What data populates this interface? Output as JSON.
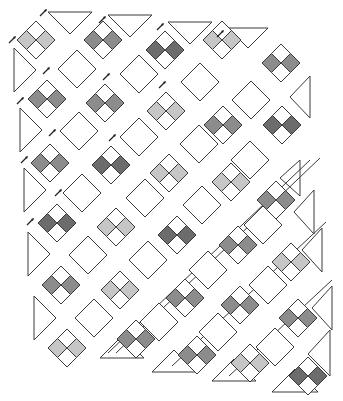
{
  "diagram": {
    "type": "quilt-layout-on-point",
    "colors": {
      "background": "#ffffff",
      "outline": "#3a3a3a",
      "plain": "#ffffff",
      "light": "#c6c6c6",
      "medium": "#8c8c8c",
      "dark": "#6c6c6c"
    },
    "block_half_diagonal": 19,
    "four_patch_blocks": [
      {
        "cx": 36,
        "cy": 40,
        "shade": "light"
      },
      {
        "cx": 103,
        "cy": 40,
        "shade": "medium"
      },
      {
        "cx": 165,
        "cy": 50,
        "shade": "dark"
      },
      {
        "cx": 222,
        "cy": 40,
        "shade": "light"
      },
      {
        "cx": 281,
        "cy": 63,
        "shade": "medium"
      },
      {
        "cx": 47,
        "cy": 99,
        "shade": "medium"
      },
      {
        "cx": 105,
        "cy": 103,
        "shade": "medium"
      },
      {
        "cx": 166,
        "cy": 111,
        "shade": "light"
      },
      {
        "cx": 223,
        "cy": 125,
        "shade": "medium"
      },
      {
        "cx": 282,
        "cy": 125,
        "shade": "dark"
      },
      {
        "cx": 50,
        "cy": 163,
        "shade": "medium"
      },
      {
        "cx": 111,
        "cy": 165,
        "shade": "dark"
      },
      {
        "cx": 169,
        "cy": 173,
        "shade": "light"
      },
      {
        "cx": 231,
        "cy": 182,
        "shade": "light"
      },
      {
        "cx": 276,
        "cy": 200,
        "shade": "medium"
      },
      {
        "cx": 57,
        "cy": 223,
        "shade": "dark"
      },
      {
        "cx": 116,
        "cy": 227,
        "shade": "light"
      },
      {
        "cx": 177,
        "cy": 235,
        "shade": "dark"
      },
      {
        "cx": 238,
        "cy": 245,
        "shade": "medium"
      },
      {
        "cx": 291,
        "cy": 262,
        "shade": "light"
      },
      {
        "cx": 61,
        "cy": 285,
        "shade": "medium"
      },
      {
        "cx": 120,
        "cy": 290,
        "shade": "light"
      },
      {
        "cx": 185,
        "cy": 298,
        "shade": "medium"
      },
      {
        "cx": 240,
        "cy": 305,
        "shade": "medium"
      },
      {
        "cx": 298,
        "cy": 318,
        "shade": "medium"
      },
      {
        "cx": 67,
        "cy": 348,
        "shade": "light"
      },
      {
        "cx": 136,
        "cy": 339,
        "shade": "medium"
      },
      {
        "cx": 197,
        "cy": 355,
        "shade": "medium"
      },
      {
        "cx": 250,
        "cy": 363,
        "shade": "light"
      },
      {
        "cx": 308,
        "cy": 376,
        "shade": "dark"
      }
    ],
    "plain_blocks": [
      {
        "cx": 77,
        "cy": 69
      },
      {
        "cx": 139,
        "cy": 74
      },
      {
        "cx": 200,
        "cy": 82
      },
      {
        "cx": 251,
        "cy": 100
      },
      {
        "cx": 79,
        "cy": 131
      },
      {
        "cx": 139,
        "cy": 137
      },
      {
        "cx": 199,
        "cy": 144
      },
      {
        "cx": 250,
        "cy": 160
      },
      {
        "cx": 82,
        "cy": 193
      },
      {
        "cx": 145,
        "cy": 198
      },
      {
        "cx": 202,
        "cy": 205
      },
      {
        "cx": 263,
        "cy": 225
      },
      {
        "cx": 88,
        "cy": 255
      },
      {
        "cx": 148,
        "cy": 260
      },
      {
        "cx": 208,
        "cy": 270
      },
      {
        "cx": 268,
        "cy": 285
      },
      {
        "cx": 94,
        "cy": 318
      },
      {
        "cx": 159,
        "cy": 322
      },
      {
        "cx": 218,
        "cy": 332
      },
      {
        "cx": 275,
        "cy": 347
      }
    ],
    "setting_triangles": [
      {
        "points": "48,12 92,12 70,34"
      },
      {
        "points": "108,15 152,15 130,37"
      },
      {
        "points": "168,22 212,22 190,44"
      },
      {
        "points": "228,28 268,28 248,48"
      },
      {
        "points": "14,48 14,92 36,70"
      },
      {
        "points": "20,108 20,152 42,130"
      },
      {
        "points": "24,168 24,212 46,190"
      },
      {
        "points": "28,232 28,276 50,254"
      },
      {
        "points": "34,296 34,340 56,318"
      },
      {
        "points": "310,76 310,118 290,97"
      },
      {
        "points": "300,160 300,196 280,178"
      },
      {
        "points": "314,190 314,234 294,212"
      },
      {
        "points": "322,228 322,272 302,250"
      },
      {
        "points": "332,286 332,330 312,308"
      },
      {
        "points": "100,358 144,358 122,336"
      },
      {
        "points": "152,372 196,372 174,350"
      },
      {
        "points": "212,381 256,381 234,359"
      },
      {
        "points": "272,392 318,392 295,369"
      },
      {
        "points": "330,330 330,376 308,354"
      }
    ],
    "sashing_strips": [
      {
        "x1": 116,
        "y1": 353,
        "x2": 320,
        "y2": 158
      },
      {
        "x1": 172,
        "y1": 366,
        "x2": 326,
        "y2": 222
      },
      {
        "x1": 229,
        "y1": 376,
        "x2": 332,
        "y2": 280
      },
      {
        "x1": 108,
        "y1": 353,
        "x2": 310,
        "y2": 160
      }
    ],
    "direction_arrows": [
      {
        "x": 43,
        "y": 13
      },
      {
        "x": 102,
        "y": 20
      },
      {
        "x": 160,
        "y": 27
      },
      {
        "x": 220,
        "y": 34
      },
      {
        "x": 12,
        "y": 40
      },
      {
        "x": 46,
        "y": 71
      },
      {
        "x": 106,
        "y": 77
      },
      {
        "x": 162,
        "y": 85
      },
      {
        "x": 20,
        "y": 101
      },
      {
        "x": 52,
        "y": 133
      },
      {
        "x": 112,
        "y": 138
      },
      {
        "x": 24,
        "y": 160
      },
      {
        "x": 58,
        "y": 193
      },
      {
        "x": 30,
        "y": 222
      }
    ]
  }
}
